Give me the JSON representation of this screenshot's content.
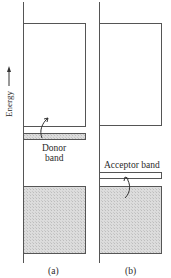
{
  "diagram": {
    "axis_label": "Energy",
    "panels": [
      {
        "id": "a",
        "caption": "(a)",
        "band_label_line1": "Donor",
        "band_label_line2": "band"
      },
      {
        "id": "b",
        "caption": "(b)",
        "band_label": "Acceptor band"
      }
    ],
    "colors": {
      "line": "#555555",
      "filled_band": "#d9d9d9",
      "background": "#ffffff"
    }
  }
}
